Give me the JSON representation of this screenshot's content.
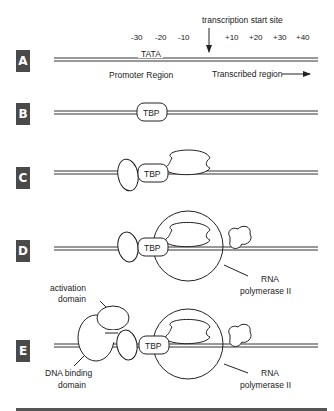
{
  "panels": [
    {
      "label": "A"
    },
    {
      "label": "B"
    },
    {
      "label": "C"
    },
    {
      "label": "D"
    },
    {
      "label": "E"
    }
  ],
  "panel_a": {
    "start_site_label": "transcription start site",
    "positions": [
      "-30",
      "-20",
      "-10",
      "+10",
      "+20",
      "+30",
      "+40"
    ],
    "tata_label": "TATA",
    "promoter_label": "Promoter Region",
    "transcribed_label": "Transcribed region"
  },
  "tbp_label": "TBP",
  "rna_pol_label_line1": "RNA",
  "rna_pol_label_line2": "polymerase  II",
  "activation_domain_line1": "activation",
  "activation_domain_line2": "domain",
  "dna_binding_line1": "DNA binding",
  "dna_binding_line2": "domain"
}
